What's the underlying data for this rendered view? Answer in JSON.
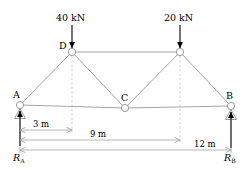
{
  "diagram": {
    "colors": {
      "member": "#9a9a9a",
      "node_stroke": "#8c8c8c",
      "node_fill": "#ffffff",
      "load_arrow": "#000000",
      "dimension": "#9a9a9a",
      "dashed": "#b5b5b5",
      "text": "#000000",
      "background": "#ffffff"
    },
    "loads": [
      {
        "name": "load-d",
        "label": "40 kN",
        "magnitude": 40,
        "unit": "kN",
        "at_node": "D"
      },
      {
        "name": "load-e",
        "label": "20 kN",
        "magnitude": 20,
        "unit": "kN",
        "at_node": "E"
      }
    ],
    "nodes": [
      {
        "id": "A",
        "label": "A",
        "x": 20,
        "y": 105
      },
      {
        "id": "D",
        "label": "D",
        "x": 72,
        "y": 52
      },
      {
        "id": "C",
        "label": "C",
        "x": 125,
        "y": 108
      },
      {
        "id": "E",
        "label": "",
        "x": 180,
        "y": 52
      },
      {
        "id": "B",
        "label": "B",
        "x": 231,
        "y": 106
      }
    ],
    "members": [
      {
        "from": "A",
        "to": "D"
      },
      {
        "from": "D",
        "to": "C"
      },
      {
        "from": "C",
        "to": "E"
      },
      {
        "from": "E",
        "to": "B"
      },
      {
        "from": "D",
        "to": "E"
      },
      {
        "from": "A",
        "to": "C"
      },
      {
        "from": "C",
        "to": "B"
      }
    ],
    "dimensions": [
      {
        "name": "dim-3m",
        "label": "3 m",
        "value": 3,
        "unit": "m",
        "from_x": 20,
        "to_x": 72,
        "y": 130
      },
      {
        "name": "dim-9m",
        "label": "9 m",
        "value": 9,
        "unit": "m",
        "from_x": 20,
        "to_x": 180,
        "y": 140
      },
      {
        "name": "dim-12m",
        "label": "12 m",
        "value": 12,
        "unit": "m",
        "from_x": 20,
        "to_x": 231,
        "y": 150
      }
    ],
    "reactions": [
      {
        "name": "reaction-a",
        "symbol": "R",
        "subscript": "A",
        "at_node": "A"
      },
      {
        "name": "reaction-b",
        "symbol": "R",
        "subscript": "B",
        "at_node": "B"
      }
    ]
  }
}
